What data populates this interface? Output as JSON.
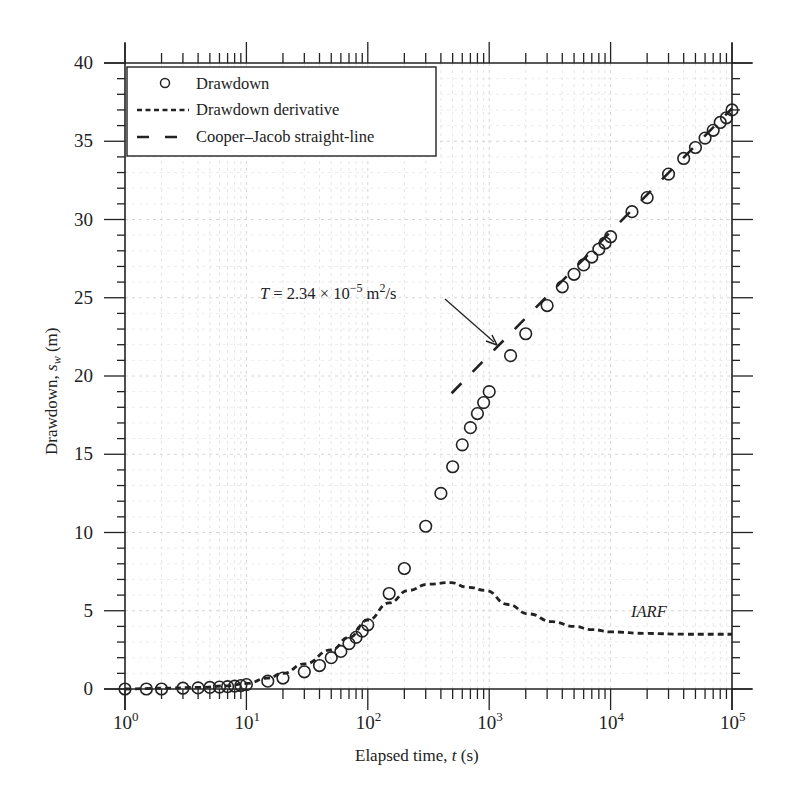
{
  "chart_data": {
    "type": "scatter",
    "title": "",
    "xlabel": "Elapsed time, t (s)",
    "xlabel_parts": {
      "pre": "Elapsed time, ",
      "italic": "t",
      "post": " (s)"
    },
    "ylabel": "Drawdown, s_w (m)",
    "ylabel_parts": {
      "pre": "Drawdown, ",
      "italic": "s",
      "sub": "w",
      "post": " (m)"
    },
    "xscale": "log",
    "xlim": [
      1,
      100000
    ],
    "ylim": [
      0,
      40
    ],
    "xticks": [
      {
        "value": 1,
        "base": "10",
        "exp": "0"
      },
      {
        "value": 10,
        "base": "10",
        "exp": "1"
      },
      {
        "value": 100,
        "base": "10",
        "exp": "2"
      },
      {
        "value": 1000,
        "base": "10",
        "exp": "3"
      },
      {
        "value": 10000,
        "base": "10",
        "exp": "4"
      },
      {
        "value": 100000,
        "base": "10",
        "exp": "5"
      }
    ],
    "yticks": [
      0,
      5,
      10,
      15,
      20,
      25,
      30,
      35,
      40
    ],
    "grid": true,
    "legend_position": "upper left",
    "legend": [
      {
        "label": "Drawdown",
        "style": "circle"
      },
      {
        "label": "Drawdown derivative",
        "style": "dotted"
      },
      {
        "label": "Cooper–Jacob straight-line",
        "style": "dashed"
      }
    ],
    "series": [
      {
        "name": "Drawdown",
        "style": "circle",
        "x": [
          1,
          1.5,
          2,
          3,
          4,
          5,
          6,
          7,
          8,
          9,
          10,
          15,
          20,
          30,
          40,
          50,
          60,
          70,
          80,
          90,
          100,
          150,
          200,
          300,
          400,
          500,
          600,
          700,
          800,
          900,
          1000,
          1500,
          2000,
          3000,
          4000,
          5000,
          6000,
          7000,
          8000,
          9000,
          10000,
          15000,
          20000,
          30000,
          40000,
          50000,
          60000,
          70000,
          80000,
          90000,
          100000
        ],
        "y": [
          0.0,
          0.0,
          0.0,
          0.05,
          0.07,
          0.1,
          0.12,
          0.15,
          0.18,
          0.22,
          0.28,
          0.5,
          0.7,
          1.1,
          1.5,
          2.0,
          2.4,
          2.9,
          3.3,
          3.7,
          4.1,
          6.1,
          7.7,
          10.4,
          12.5,
          14.2,
          15.6,
          16.7,
          17.6,
          18.3,
          19.0,
          21.3,
          22.7,
          24.5,
          25.7,
          26.5,
          27.1,
          27.6,
          28.1,
          28.5,
          28.9,
          30.5,
          31.4,
          32.9,
          33.9,
          34.6,
          35.2,
          35.7,
          36.2,
          36.5,
          37.0
        ]
      },
      {
        "name": "Drawdown derivative",
        "style": "dotted",
        "x": [
          1,
          2,
          4,
          7,
          10,
          15,
          20,
          30,
          50,
          70,
          100,
          150,
          216,
          316,
          480,
          670,
          930,
          1430,
          2100,
          3300,
          5000,
          7000,
          10000,
          20000,
          40000,
          100000
        ],
        "y": [
          0.0,
          0.05,
          0.1,
          0.2,
          0.35,
          0.7,
          1.0,
          1.6,
          2.5,
          3.3,
          4.4,
          5.5,
          6.3,
          6.7,
          6.8,
          6.5,
          6.3,
          5.4,
          4.8,
          4.3,
          4.0,
          3.8,
          3.65,
          3.55,
          3.5,
          3.5
        ]
      },
      {
        "name": "Cooper–Jacob straight-line",
        "style": "dashed",
        "x": [
          490,
          100000
        ],
        "y": [
          18.9,
          37.1
        ]
      }
    ],
    "annotations": [
      {
        "text": "T = 2.34 × 10⁻⁵ m²/s",
        "parts": {
          "italic": "T",
          "eq": " = 2.34 × 10",
          "exp": "−5",
          "unit": " m",
          "unit_exp": "2",
          "tail": "/s"
        },
        "arrow_to": {
          "x": 1200,
          "y": 22
        }
      },
      {
        "text": "IARF",
        "x": 17000,
        "y": 5
      }
    ]
  }
}
